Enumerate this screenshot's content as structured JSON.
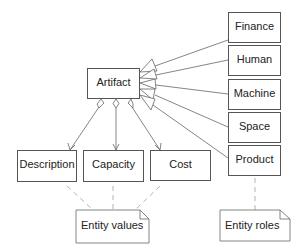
{
  "diagram": {
    "central": {
      "label": "Artifact"
    },
    "roles": [
      {
        "label": "Finance"
      },
      {
        "label": "Human"
      },
      {
        "label": "Machine"
      },
      {
        "label": "Space"
      },
      {
        "label": "Product"
      }
    ],
    "attributes": [
      {
        "label": "Description"
      },
      {
        "label": "Capacity"
      },
      {
        "label": "Cost"
      }
    ],
    "notes": {
      "values": {
        "label": "Entity values"
      },
      "roles": {
        "label": "Entity roles"
      }
    },
    "colors": {
      "stroke": "#555555",
      "dashed": "#999999",
      "text": "#222222"
    }
  }
}
